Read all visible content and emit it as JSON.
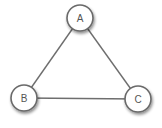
{
  "diagram": {
    "type": "graph",
    "nodes": [
      {
        "id": "A",
        "label": "A",
        "cx": 80,
        "cy": 18
      },
      {
        "id": "B",
        "label": "B",
        "cx": 24,
        "cy": 98
      },
      {
        "id": "C",
        "label": "C",
        "cx": 138,
        "cy": 99
      }
    ],
    "edges": [
      {
        "from": "A",
        "to": "B"
      },
      {
        "from": "A",
        "to": "C"
      },
      {
        "from": "B",
        "to": "C"
      }
    ]
  }
}
